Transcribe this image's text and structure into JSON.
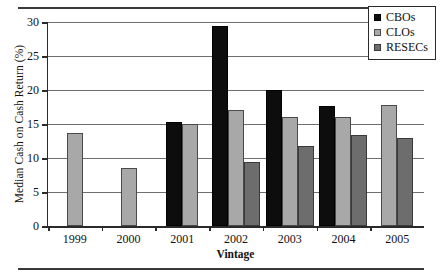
{
  "figure": {
    "top_rule": true,
    "bottom_rule": true
  },
  "chart_data": {
    "type": "bar",
    "title": "",
    "xlabel": "Vintage",
    "ylabel": "Median Cash on Cash Return (%)",
    "categories": [
      "1999",
      "2000",
      "2001",
      "2002",
      "2003",
      "2004",
      "2005"
    ],
    "series": [
      {
        "name": "CBOs",
        "color": "#0d0d0d",
        "values": [
          null,
          null,
          15.3,
          29.4,
          20.0,
          17.6,
          null
        ]
      },
      {
        "name": "CLOs",
        "color": "#a8a8a8",
        "values": [
          13.7,
          8.6,
          15.0,
          17.0,
          16.1,
          16.0,
          17.8
        ]
      },
      {
        "name": "RESECs",
        "color": "#6d6d6d",
        "values": [
          null,
          null,
          null,
          9.4,
          11.8,
          13.4,
          13.0
        ]
      }
    ],
    "ylim": [
      0,
      30
    ],
    "yticks": [
      0,
      5,
      10,
      15,
      20,
      25,
      30
    ],
    "ytick_labels": [
      "0",
      "5",
      "10",
      "15",
      "20",
      "25",
      "30"
    ],
    "grid": true,
    "grid_axis": "y",
    "legend_position": "top-right",
    "legend_entries": [
      "CBOs",
      "CLOs",
      "RESECs"
    ]
  }
}
